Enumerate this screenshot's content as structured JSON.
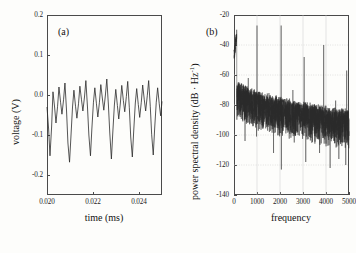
{
  "figure": {
    "background_color": "#fdfdfb",
    "line_color": "#2b2b2b",
    "axis_color": "#4a4a4a",
    "grid_color": "#c8c8c8"
  },
  "panels": [
    {
      "letter": "(a)",
      "xlabel": "time (ms)",
      "ylabel": "voltage (V)",
      "xticks": [
        "0.020",
        "0.022",
        "0.024"
      ],
      "xtick_values": [
        0.02,
        0.022,
        0.024
      ],
      "yticks": [
        "0.2",
        "0.1",
        "0.0",
        "-0.1",
        "-0.2"
      ],
      "ytick_values": [
        0.2,
        0.1,
        0.0,
        -0.1,
        -0.2
      ],
      "xlim": [
        0.02,
        0.025
      ],
      "ylim": [
        -0.25,
        0.2
      ],
      "grid": false
    },
    {
      "letter": "(b)",
      "xlabel": "frequency",
      "ylabel_main": "power spectral density (dB · Hz",
      "ylabel_sup": "-1",
      "ylabel_tail": ")",
      "ylabel": "power spectral density (dB · Hz⁻¹)",
      "xticks": [
        "0",
        "1000",
        "2000",
        "3000",
        "4000",
        "5000"
      ],
      "xtick_values": [
        0,
        1000,
        2000,
        3000,
        4000,
        5000
      ],
      "yticks": [
        "-20",
        "-40",
        "-60",
        "-80",
        "-100",
        "-120",
        "-140"
      ],
      "ytick_values": [
        -20,
        -40,
        -60,
        -80,
        -100,
        -120,
        -140
      ],
      "xlim": [
        0,
        5000
      ],
      "ylim": [
        -140,
        -20
      ],
      "grid": true
    }
  ],
  "chart_data": [
    {
      "type": "line",
      "panel": "(a)",
      "title": "",
      "xlabel": "time (ms)",
      "ylabel": "voltage (V)",
      "xlim": [
        0.02,
        0.025
      ],
      "ylim": [
        -0.25,
        0.2
      ],
      "grid": false,
      "series_name": "voltage waveform",
      "description": "Quasi-periodic oscillation, roughly 5 major cycles across 0.020-0.025 ms; each cycle has a deep trough near -0.15 V and a cluster of small peaks near 0.00 to 0.04 V.",
      "x": [
        0.02,
        0.02007,
        0.02013,
        0.0202,
        0.02026,
        0.02033,
        0.02039,
        0.02046,
        0.02052,
        0.02059,
        0.02065,
        0.02072,
        0.02078,
        0.02085,
        0.02091,
        0.02098,
        0.02104,
        0.02111,
        0.02117,
        0.02124,
        0.0213,
        0.02137,
        0.02143,
        0.0215,
        0.02156,
        0.02163,
        0.02169,
        0.02176,
        0.02182,
        0.02189,
        0.02195,
        0.02202,
        0.02208,
        0.02215,
        0.02221,
        0.02228,
        0.02234,
        0.02241,
        0.02247,
        0.02254,
        0.0226,
        0.02267,
        0.02273,
        0.0228,
        0.02286,
        0.02293,
        0.02299,
        0.02306,
        0.02312,
        0.02319,
        0.02325,
        0.02332,
        0.02338,
        0.02345,
        0.02351,
        0.02358,
        0.02364,
        0.02371,
        0.02377,
        0.02384,
        0.0239,
        0.02397,
        0.02403,
        0.0241,
        0.02416,
        0.02423,
        0.02429,
        0.02436,
        0.02442,
        0.02449,
        0.02455,
        0.02462,
        0.02468,
        0.02475,
        0.02481,
        0.02488,
        0.02494,
        0.025
      ],
      "y": [
        -0.03,
        -0.085,
        -0.152,
        -0.08,
        0.008,
        -0.03,
        -0.07,
        -0.028,
        0.02,
        -0.018,
        -0.048,
        -0.012,
        0.03,
        -0.04,
        -0.12,
        -0.168,
        -0.105,
        -0.03,
        0.012,
        -0.028,
        -0.058,
        -0.022,
        0.022,
        -0.012,
        -0.04,
        -0.005,
        0.036,
        -0.03,
        -0.1,
        -0.152,
        -0.085,
        -0.018,
        0.018,
        -0.022,
        -0.055,
        -0.018,
        0.026,
        -0.01,
        -0.038,
        0.0,
        0.04,
        -0.025,
        -0.095,
        -0.16,
        -0.095,
        -0.025,
        0.014,
        -0.026,
        -0.06,
        -0.02,
        0.024,
        -0.014,
        -0.042,
        -0.004,
        0.034,
        -0.032,
        -0.105,
        -0.155,
        -0.09,
        -0.02,
        0.016,
        -0.024,
        -0.056,
        -0.018,
        0.025,
        -0.012,
        -0.04,
        -0.002,
        0.036,
        -0.028,
        -0.098,
        -0.15,
        -0.085,
        -0.018,
        0.018,
        -0.022,
        -0.052,
        -0.016,
        -0.03
      ],
      "notes": "voltage in volts, time in milliseconds"
    },
    {
      "type": "line",
      "panel": "(b)",
      "title": "",
      "xlabel": "frequency",
      "ylabel": "power spectral density (dB · Hz^-1)",
      "xlim": [
        0,
        5000
      ],
      "ylim": [
        -140,
        -20
      ],
      "grid": true,
      "series_name": "power spectral density",
      "description": "Broadband noise floor falling from about -60 dB near DC to about -85 dB near 5000 Hz, with sharp harmonic spikes.",
      "dc_peak_db": -43,
      "noise_floor_start_db": -60,
      "noise_floor_end_db": -85,
      "noise_floor_spread_db": 22,
      "peaks": [
        {
          "frequency": 1000,
          "level_db": -27
        },
        {
          "frequency": 2050,
          "level_db": -27
        },
        {
          "frequency": 3050,
          "level_db": -48
        },
        {
          "frequency": 3900,
          "level_db": -40
        },
        {
          "frequency": 4900,
          "level_db": -57
        },
        {
          "frequency": 620,
          "level_db": -62
        },
        {
          "frequency": 1520,
          "level_db": -72
        },
        {
          "frequency": 2560,
          "level_db": -70
        },
        {
          "frequency": 4420,
          "level_db": -77
        }
      ],
      "downward_spikes": [
        {
          "frequency": 480,
          "level_db": -104
        },
        {
          "frequency": 980,
          "level_db": -101
        },
        {
          "frequency": 1720,
          "level_db": -112
        },
        {
          "frequency": 2060,
          "level_db": -123
        },
        {
          "frequency": 2620,
          "level_db": -105
        },
        {
          "frequency": 3120,
          "level_db": -118
        },
        {
          "frequency": 3720,
          "level_db": -112
        },
        {
          "frequency": 4180,
          "level_db": -122
        },
        {
          "frequency": 4560,
          "level_db": -116
        },
        {
          "frequency": 4860,
          "level_db": -120
        }
      ]
    }
  ]
}
